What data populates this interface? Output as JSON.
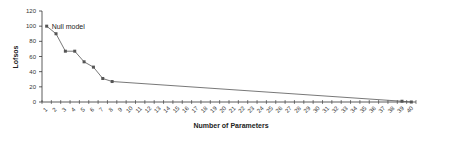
{
  "chart_data": {
    "type": "line",
    "title": "",
    "xlabel": "Number of Parameters",
    "ylabel": "Lofsos",
    "ylim": [
      0,
      120
    ],
    "yticks": [
      0,
      20,
      40,
      60,
      80,
      100,
      120
    ],
    "x_categories": [
      1,
      2,
      3,
      4,
      5,
      6,
      7,
      8,
      9,
      10,
      11,
      12,
      13,
      14,
      15,
      16,
      17,
      18,
      19,
      20,
      21,
      22,
      23,
      24,
      25,
      26,
      27,
      28,
      29,
      30,
      31,
      32,
      33,
      34,
      35,
      36,
      37,
      38,
      39,
      40
    ],
    "grid": false,
    "legend": null,
    "series": [
      {
        "name": "Lofsos",
        "points": [
          {
            "x": 1,
            "y": 100
          },
          {
            "x": 2,
            "y": 90
          },
          {
            "x": 3,
            "y": 67
          },
          {
            "x": 4,
            "y": 67
          },
          {
            "x": 5,
            "y": 53
          },
          {
            "x": 6,
            "y": 46
          },
          {
            "x": 7,
            "y": 31
          },
          {
            "x": 8,
            "y": 27
          },
          {
            "x": 39,
            "y": 1
          },
          {
            "x": 40,
            "y": 0
          }
        ]
      }
    ],
    "annotations": [
      {
        "text": "Null model",
        "x": 1,
        "y": 100
      }
    ],
    "colors": {
      "line": "#555555",
      "marker": "#555555",
      "axis": "#333333"
    }
  }
}
